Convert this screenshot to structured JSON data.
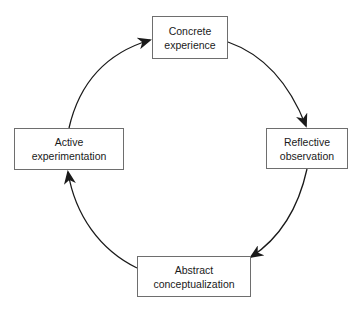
{
  "diagram": {
    "type": "cycle",
    "nodes": [
      {
        "id": "concrete",
        "line1": "Concrete",
        "line2": "experience"
      },
      {
        "id": "reflective",
        "line1": "Reflective",
        "line2": "observation"
      },
      {
        "id": "abstract",
        "line1": "Abstract",
        "line2": "conceptualization"
      },
      {
        "id": "active",
        "line1": "Active",
        "line2": "experimentation"
      }
    ],
    "edges": [
      {
        "from": "concrete",
        "to": "reflective"
      },
      {
        "from": "reflective",
        "to": "abstract"
      },
      {
        "from": "abstract",
        "to": "active"
      },
      {
        "from": "active",
        "to": "concrete"
      }
    ],
    "colors": {
      "stroke": "#1a1a1a",
      "box_border": "#6e6e6e",
      "background": "#ffffff"
    }
  }
}
